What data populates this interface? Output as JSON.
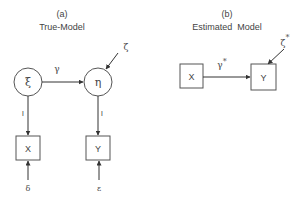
{
  "panel_a": {
    "label": "(a)",
    "title": "True-Model",
    "latent_exogenous": "ξ",
    "latent_endogenous": "η",
    "path_coefficient": "γ",
    "disturbance": "ζ",
    "loading_x": "l",
    "loading_y": "l",
    "indicator_x": "X",
    "indicator_y": "Y",
    "error_x": "δ",
    "error_y": "ε"
  },
  "panel_b": {
    "label": "(b)",
    "title": "Estimated  Model",
    "observed_x": "X",
    "observed_y": "Y",
    "path_coefficient": "γ",
    "path_star": "*",
    "disturbance": "ζ",
    "disturbance_star": "*"
  },
  "colors": {
    "stroke": "#444444",
    "background": "#ffffff"
  }
}
